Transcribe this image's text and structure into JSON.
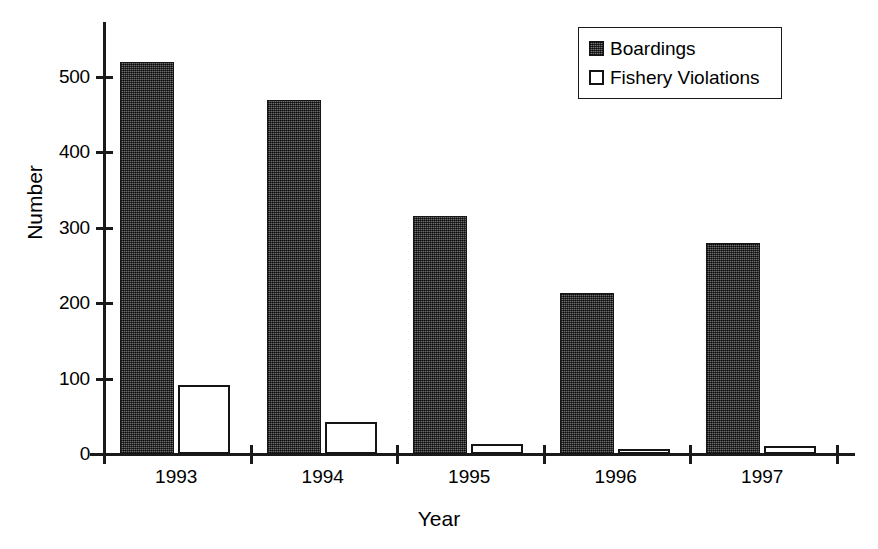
{
  "chart_data": {
    "type": "bar",
    "title": "",
    "xlabel": "Year",
    "ylabel": "Number",
    "categories": [
      "1993",
      "1994",
      "1995",
      "1996",
      "1997"
    ],
    "series": [
      {
        "name": "Boardings",
        "values": [
          520,
          470,
          315,
          213,
          280
        ],
        "fill": "dark-hatched"
      },
      {
        "name": "Fishery Violations",
        "values": [
          92,
          42,
          13,
          6,
          11
        ],
        "fill": "white"
      }
    ],
    "ylim": [
      0,
      560
    ],
    "yticks": [
      0,
      100,
      200,
      300,
      400,
      500
    ],
    "ytick_labels": [
      "0",
      "100",
      "200",
      "300",
      "400",
      "500"
    ],
    "grid": false,
    "legend_position": "top-right"
  },
  "axes": {
    "y_title": "Number",
    "x_title": "Year"
  },
  "legend": {
    "entries": [
      {
        "label": "Boardings",
        "swatch": "dark-hatched-swatch"
      },
      {
        "label": "Fishery Violations",
        "swatch": "white-swatch"
      }
    ]
  },
  "colors": {
    "boardings": "#4a4a4a",
    "violations": "#ffffff",
    "axis": "#1a1a1a",
    "background": "#ffffff"
  }
}
